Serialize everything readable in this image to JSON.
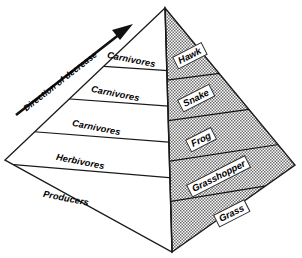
{
  "figure": {
    "type": "ecological-pyramid-diagram",
    "annotation": {
      "arrow_label": "Direction of decrease",
      "arrow_direction": "up-right"
    },
    "colors": {
      "outline": "#1a1a1a",
      "left_face": "#ffffff",
      "right_face_stipple": "#808080",
      "label_box": "#ffffff",
      "text": "#000000"
    },
    "levels": [
      {
        "trophic_label": "Carnivores",
        "organism": "Hawk"
      },
      {
        "trophic_label": "Carnivores",
        "organism": "Snake"
      },
      {
        "trophic_label": "Carnivores",
        "organism": "Frog"
      },
      {
        "trophic_label": "Herbivores",
        "organism": "Grasshopper"
      },
      {
        "trophic_label": "Producers",
        "organism": "Grass"
      }
    ]
  }
}
